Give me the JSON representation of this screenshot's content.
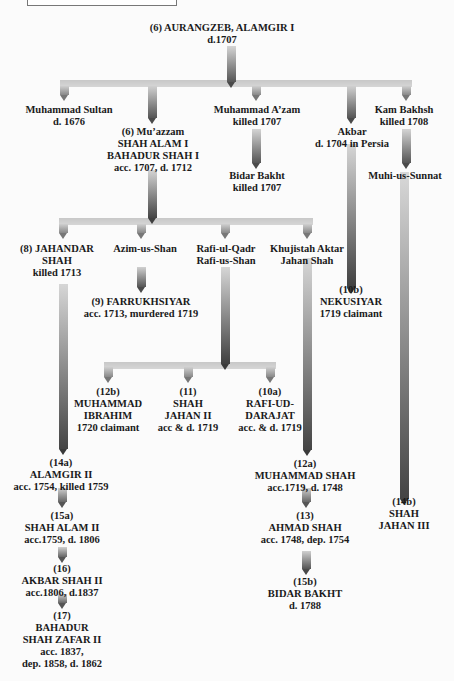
{
  "colors": {
    "arrow_light": "#d2d2d2",
    "arrow_dark": "#4a4a4a",
    "bar": "#cfcfcf",
    "text": "#1a1a1a"
  },
  "nodes": {
    "aurangzeb": [
      "(6)  AURANGZEB, ALAMGIR I",
      "d.1707"
    ],
    "muhammad_sultan": [
      "Muhammad Sultan",
      "d. 1676"
    ],
    "muazzam": [
      "(6)  Mu’azzam",
      "SHAH ALAM I",
      "BAHADUR SHAH I",
      "acc. 1707, d. 1712"
    ],
    "muhammad_azam": [
      "Muhammad A’zam",
      "killed 1707"
    ],
    "akbar": [
      "Akbar",
      "d. 1704 in Persia"
    ],
    "kam_bakhsh": [
      "Kam Bakhsh",
      "killed 1708"
    ],
    "bidar_bakht": [
      "Bidar Bakht",
      "killed 1707"
    ],
    "muhi_us_sunnat": [
      "Muhi-us-Sunnat"
    ],
    "jahandar_shah": [
      "(8)  JAHANDAR",
      "SHAH",
      "killed 1713"
    ],
    "azim_us_shan": [
      "Azim-us-Shan"
    ],
    "rafi_ul_qadr": [
      "Rafi-ul-Qadr",
      "Rafi-us-Shan"
    ],
    "khujistah": [
      "Khujistah Aktar",
      "Jahan Shah"
    ],
    "farrukhsiyar": [
      "(9)  FARRUKHSIYAR",
      "acc. 1713, murdered 1719"
    ],
    "nekusiyar": [
      "(10b)",
      "NEKUSIYAR",
      "1719 claimant"
    ],
    "muhammad_ibrahim": [
      "(12b)",
      "MUHAMMAD",
      "IBRAHIM",
      "1720 claimant"
    ],
    "shah_jahan_ii": [
      "(11)",
      "SHAH",
      "JAHAN II",
      "acc & d. 1719"
    ],
    "rafi_ud_darajat": [
      "(10a)",
      "RAFI-UD-",
      "DARAJAT",
      "acc. & d. 1719"
    ],
    "alamgir_ii": [
      "(14a)",
      "ALAMGIR II",
      "acc. 1754, killed 1759"
    ],
    "muhammad_shah": [
      "(12a)",
      "MUHAMMAD SHAH",
      "acc.1719, d. 1748"
    ],
    "shah_jahan_iii": [
      "(14b)",
      "SHAH",
      "JAHAN III"
    ],
    "shah_alam_ii": [
      "(15a)",
      "SHAH ALAM II",
      "acc.1759, d. 1806"
    ],
    "ahmad_shah": [
      "(13)",
      "AHMAD SHAH",
      "acc. 1748, dep. 1754"
    ],
    "akbar_shah_ii": [
      "(16)",
      "AKBAR SHAH II",
      "acc.1806, d.1837"
    ],
    "bidar_bakht_15b": [
      "(15b)",
      "BIDAR BAKHT",
      "d. 1788"
    ],
    "bahadur_shah_zafar": [
      "(17)",
      "BAHADUR",
      "SHAH ZAFAR II",
      "acc. 1837,",
      "dep. 1858, d. 1862"
    ]
  }
}
